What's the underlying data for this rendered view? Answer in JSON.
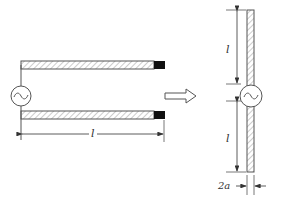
{
  "diagram": {
    "left_figure": {
      "description": "Open-ended two-wire line fed by AC source",
      "source_symbol": "~",
      "length_label": "l"
    },
    "transform_arrow": "arrow-right",
    "right_figure": {
      "description": "Symmetric dipole with center feed",
      "source_symbol": "~",
      "upper_arm_label": "l",
      "lower_arm_label": "l",
      "diameter_label": "2a"
    },
    "colors": {
      "line": "#555555",
      "hatch": "#888888",
      "tip": "#111111",
      "background": "#ffffff"
    }
  }
}
